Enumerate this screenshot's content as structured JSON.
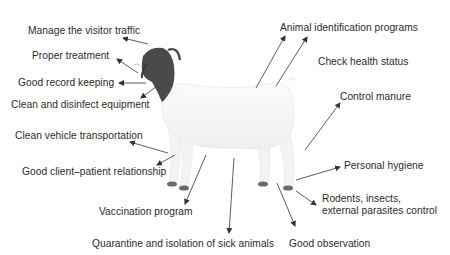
{
  "figure": {
    "colors": {
      "text": "#2b2b2b",
      "arrow": "#333333",
      "goat_head": "#4a4a4a",
      "goat_body": "#f7f7f7",
      "hooves": "#6a6a6a"
    }
  },
  "labels": [
    {
      "id": "manage-visitor-traffic",
      "text": "Manage the visitor traffic",
      "x": 28,
      "y": 25
    },
    {
      "id": "proper-treatment",
      "text": "Proper treatment",
      "x": 32,
      "y": 50
    },
    {
      "id": "good-record-keeping",
      "text": "Good record keeping",
      "x": 18,
      "y": 77
    },
    {
      "id": "clean-disinfect-equipment",
      "text": "Clean and disinfect equipment",
      "x": 11,
      "y": 99
    },
    {
      "id": "clean-vehicle-transportation",
      "text": "Clean vehicle transportation",
      "x": 15,
      "y": 130
    },
    {
      "id": "good-client-patient-relationship",
      "text": "Good client–patient relationship",
      "x": 22,
      "y": 166
    },
    {
      "id": "vaccination-program",
      "text": "Vaccination program",
      "x": 99,
      "y": 206
    },
    {
      "id": "quarantine-isolation",
      "text": "Quarantine and isolation of sick animals",
      "x": 92,
      "y": 238
    },
    {
      "id": "good-observation",
      "text": "Good observation",
      "x": 289,
      "y": 238
    },
    {
      "id": "animal-identification",
      "text": "Animal identification programs",
      "x": 280,
      "y": 22
    },
    {
      "id": "check-health-status",
      "text": "Check health status",
      "x": 318,
      "y": 56
    },
    {
      "id": "control-manure",
      "text": "Control manure",
      "x": 340,
      "y": 91
    },
    {
      "id": "personal-hygiene",
      "text": "Personal hygiene",
      "x": 344,
      "y": 160
    },
    {
      "id": "rodents-insects-parasites",
      "text": "Rodents, insects,\nexternal parasites control",
      "x": 322,
      "y": 193
    }
  ],
  "arrows": [
    {
      "for": "manage-visitor-traffic",
      "from": [
        148,
        44
      ],
      "to": [
        123,
        38
      ]
    },
    {
      "for": "proper-treatment",
      "from": [
        138,
        73
      ],
      "to": [
        117,
        59
      ]
    },
    {
      "for": "good-record-keeping",
      "from": [
        146,
        83
      ],
      "to": [
        119,
        83
      ]
    },
    {
      "for": "clean-disinfect-equipment",
      "from": [
        157,
        86
      ],
      "to": [
        141,
        98
      ]
    },
    {
      "for": "clean-vehicle-transportation",
      "from": [
        168,
        153
      ],
      "to": [
        130,
        142
      ]
    },
    {
      "for": "good-client-patient-relationship",
      "from": [
        175,
        155
      ],
      "to": [
        157,
        165
      ]
    },
    {
      "for": "vaccination-program",
      "from": [
        206,
        155
      ],
      "to": [
        185,
        204
      ]
    },
    {
      "for": "quarantine-isolation",
      "from": [
        234,
        158
      ],
      "to": [
        229,
        233
      ]
    },
    {
      "for": "good-observation",
      "from": [
        277,
        183
      ],
      "to": [
        295,
        226
      ]
    },
    {
      "for": "animal-identification",
      "from": [
        256,
        88
      ],
      "to": [
        285,
        36
      ]
    },
    {
      "for": "animal-identification",
      "from": [
        276,
        86
      ],
      "to": [
        307,
        37
      ]
    },
    {
      "for": "control-manure",
      "from": [
        305,
        150
      ],
      "to": [
        340,
        103
      ]
    },
    {
      "for": "personal-hygiene",
      "from": [
        296,
        180
      ],
      "to": [
        340,
        167
      ]
    },
    {
      "for": "rodents-insects-parasites",
      "from": [
        296,
        191
      ],
      "to": [
        316,
        205
      ]
    }
  ]
}
